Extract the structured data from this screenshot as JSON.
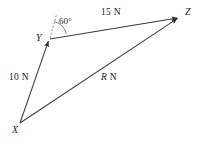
{
  "diagram": {
    "type": "vector-triangle",
    "title": "",
    "background_color": "#ffffff",
    "stroke_color": "#3a3a42",
    "vertices": [
      {
        "id": "X",
        "label": "X",
        "x": 20,
        "y": 123
      },
      {
        "id": "Y",
        "label": "Y",
        "x": 49,
        "y": 39
      },
      {
        "id": "Z",
        "label": "Z",
        "x": 180,
        "y": 17
      }
    ],
    "vectors": [
      {
        "id": "xy",
        "from": "X",
        "to": "Y",
        "label": "10 N",
        "magnitude": 10,
        "unit": "N",
        "arrowhead": "at-end"
      },
      {
        "id": "yz",
        "from": "Y",
        "to": "Z",
        "label": "15 N",
        "magnitude": 15,
        "unit": "N",
        "arrowhead": "at-end"
      },
      {
        "id": "xz",
        "from": "X",
        "to": "Z",
        "label_italic": "R",
        "label_rest": " N",
        "label": "R N",
        "magnitude": "R",
        "unit": "N",
        "arrowhead": "at-end"
      }
    ],
    "angle": {
      "at_vertex": "Y",
      "label": "60°",
      "value": 60,
      "unit": "degrees",
      "between": [
        "dashed-reference-line",
        "yz"
      ]
    },
    "reference_line": {
      "id": "dashed-reference-line",
      "style": "dashed",
      "from": {
        "x": 49,
        "y": 39
      },
      "to": {
        "x": 55,
        "y": 14
      }
    }
  }
}
